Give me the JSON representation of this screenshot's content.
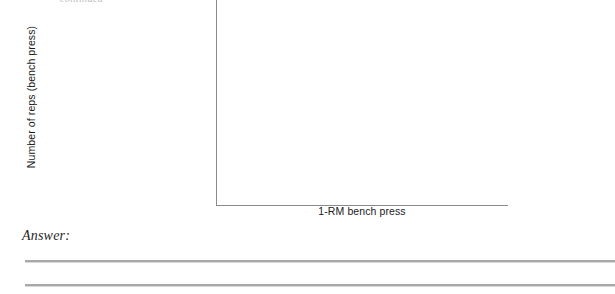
{
  "page": {
    "background_color": "#ffffff",
    "clipped_top_text": "continued"
  },
  "figure": {
    "name": "blank-scatter-axes",
    "type": "empty-axes",
    "axis_color": "#8a8a8a",
    "x_axis_label": "1-RM bench press",
    "y_axis_label": "Number of reps (bench press)",
    "plot_area_is_empty": true
  },
  "answer": {
    "label": "Answer:",
    "rule_count": 2,
    "rule_color": "#a8a8a8"
  },
  "chart_data": {
    "type": "scatter",
    "title": "",
    "subtitle": "",
    "xlabel": "1-RM bench press",
    "ylabel": "Number of reps (bench press)",
    "x": [],
    "y": [],
    "series": [],
    "xticklabels": [],
    "yticklabels": [],
    "xlim": null,
    "ylim": null,
    "grid": false,
    "legend": false,
    "annotations": [],
    "note": "Axes are drawn blank for the student to plot the expected relationship; no data points, tick marks, or tick labels are printed."
  }
}
